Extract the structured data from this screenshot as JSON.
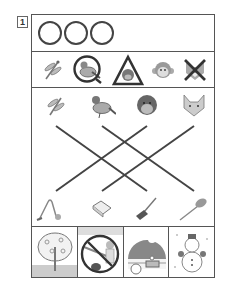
{
  "worksheet": {
    "question_number": "1",
    "answer_circles": [
      {
        "name": "answer-circle-1",
        "x": 6
      },
      {
        "name": "answer-circle-2",
        "x": 32
      },
      {
        "name": "answer-circle-3",
        "x": 58
      }
    ],
    "symbol_row": [
      {
        "icon": "dragonfly",
        "mark": "none"
      },
      {
        "icon": "pigeon",
        "mark": "circle"
      },
      {
        "icon": "gorilla",
        "mark": "triangle"
      },
      {
        "icon": "monkey",
        "mark": "none"
      },
      {
        "icon": "fox",
        "mark": "cross"
      }
    ],
    "top_animals": [
      "dragonfly",
      "pigeon",
      "gorilla",
      "fox"
    ],
    "bottom_items": [
      "vacuum-cleaner",
      "cloth",
      "broom",
      "feather-duster"
    ],
    "connecting_lines": [
      {
        "from": "dragonfly",
        "to": "broom"
      },
      {
        "from": "pigeon",
        "to": "feather-duster"
      },
      {
        "from": "gorilla",
        "to": "vacuum-cleaner"
      },
      {
        "from": "fox",
        "to": "cloth"
      }
    ],
    "scenes": [
      {
        "name": "spring-blossom-tree",
        "mark": "none"
      },
      {
        "name": "summer-fishing",
        "mark": "circle"
      },
      {
        "name": "autumn-moon-viewing",
        "mark": "none"
      },
      {
        "name": "winter-snowman",
        "mark": "none"
      }
    ],
    "colors": {
      "line": "#444444",
      "border": "#555555",
      "icon_fill": "#999999",
      "background": "#ffffff"
    }
  }
}
